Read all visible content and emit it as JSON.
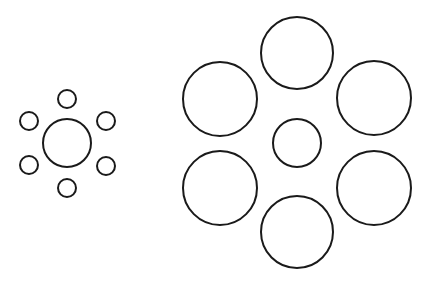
{
  "figure": {
    "width": 430,
    "height": 287,
    "stroke_color": "#1a1a1a",
    "stroke_width": 2,
    "background": "#ffffff"
  },
  "groups": [
    {
      "name": "left-cluster-small-surround",
      "center": {
        "cx": 67,
        "cy": 143,
        "r": 24
      },
      "surround": [
        {
          "cx": 67,
          "cy": 99,
          "r": 9
        },
        {
          "cx": 106,
          "cy": 121,
          "r": 9
        },
        {
          "cx": 106,
          "cy": 166,
          "r": 9
        },
        {
          "cx": 67,
          "cy": 188,
          "r": 9
        },
        {
          "cx": 29,
          "cy": 165,
          "r": 9
        },
        {
          "cx": 29,
          "cy": 121,
          "r": 9
        }
      ]
    },
    {
      "name": "right-cluster-large-surround",
      "center": {
        "cx": 297,
        "cy": 143,
        "r": 24
      },
      "surround": [
        {
          "cx": 297,
          "cy": 53,
          "r": 36
        },
        {
          "cx": 374,
          "cy": 98,
          "r": 37
        },
        {
          "cx": 374,
          "cy": 188,
          "r": 37
        },
        {
          "cx": 297,
          "cy": 232,
          "r": 36
        },
        {
          "cx": 220,
          "cy": 188,
          "r": 37
        },
        {
          "cx": 220,
          "cy": 99,
          "r": 37
        }
      ]
    }
  ]
}
